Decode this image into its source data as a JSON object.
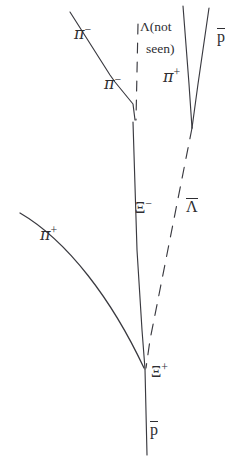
{
  "figure": {
    "kind": "bubble-chamber-event-diagram",
    "background_color": "#ffffff",
    "stroke_color": "#3a3a40",
    "text_color": "#2e2e32",
    "width": 244,
    "height": 464
  },
  "labels": {
    "pi_minus_upper": {
      "base": "π",
      "charge": "−",
      "x": 74,
      "y": 23
    },
    "pi_minus_lower": {
      "base": "π",
      "charge": "−",
      "x": 104,
      "y": 73
    },
    "lambda_not_seen_line1": {
      "text": "Λ(not",
      "x": 140,
      "y": 20
    },
    "lambda_not_seen_line2": {
      "text": "seen)",
      "x": 146,
      "y": 42
    },
    "pi_plus_top": {
      "base": "π",
      "charge": "+",
      "x": 163,
      "y": 66
    },
    "pbar_top": {
      "base": "p",
      "x": 217,
      "y": 27
    },
    "xi_minus": {
      "base": "Ξ",
      "charge": "−",
      "x": 135,
      "y": 197
    },
    "lambda_bar": {
      "base": "Λ",
      "x": 186,
      "y": 197
    },
    "pi_plus_left": {
      "base": "π",
      "charge": "+",
      "x": 40,
      "y": 224
    },
    "xi_plus": {
      "base": "Ξ",
      "charge": "+",
      "x": 151,
      "y": 361
    },
    "pbar_bottom": {
      "base": "p",
      "x": 150,
      "y": 420
    }
  },
  "tracks": [
    {
      "id": "pi-minus-incoming",
      "name": "pi-minus-track",
      "style": "solid",
      "path": "M 70 12 L 110 75 L 115 82 L 133 104 L 135 120"
    },
    {
      "id": "xi-minus-track",
      "name": "xi-minus-track",
      "style": "solid",
      "path": "M 133 122 L 137 250 L 142 330 L 145 369"
    },
    {
      "id": "lambda-bar-dashed",
      "name": "lambda-bar-track",
      "style": "dashed",
      "path": "M 192 128 L 150 340 L 146 368"
    },
    {
      "id": "lambda-dashed-vertical",
      "name": "lambda-neutral-track",
      "style": "dashed",
      "path": "M 138 24 L 136 120"
    },
    {
      "id": "pbar-from-lambdabar",
      "name": "antiproton-upper-track",
      "style": "solid",
      "path": "M 183 6 L 189 84 L 192 128"
    },
    {
      "id": "pi-plus-from-lambdabar",
      "name": "pi-plus-upper-track",
      "style": "solid",
      "path": "M 209 8 L 198 84 L 192 128"
    },
    {
      "id": "pi-plus-incoming-curve",
      "name": "pi-plus-track",
      "style": "solid",
      "path": "M 20 213 C 68 241 112 300 144 368"
    },
    {
      "id": "pbar-outgoing",
      "name": "antiproton-lower-track",
      "style": "solid",
      "path": "M 145 369 L 147 455"
    }
  ]
}
